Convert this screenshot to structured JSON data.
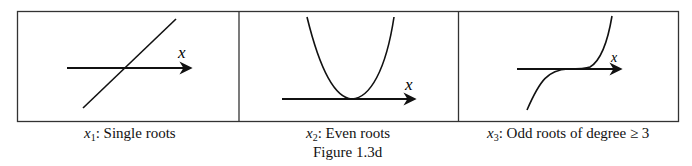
{
  "figure": {
    "title": "Figure 1.3d",
    "panels": [
      {
        "var": "x",
        "sub": "1",
        "caption": ":  Single roots",
        "axis_label": "x",
        "curve": "line"
      },
      {
        "var": "x",
        "sub": "2",
        "caption": ":  Even roots",
        "axis_label": "x",
        "curve": "parabola"
      },
      {
        "var": "x",
        "sub": "3",
        "caption": ":  Odd roots of degree ≥ 3",
        "axis_label": "x",
        "curve": "cubic"
      }
    ]
  }
}
